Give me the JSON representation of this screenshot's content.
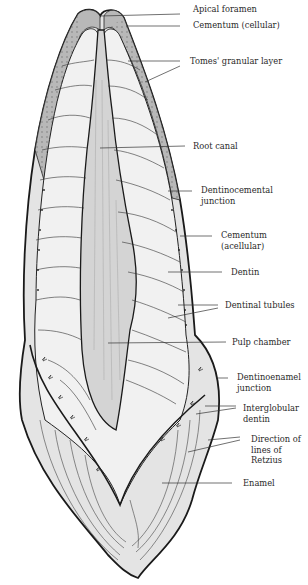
{
  "diagram": {
    "labels": [
      {
        "id": "apical-foramen",
        "text": "Apical foramen",
        "x": 193,
        "y": 6
      },
      {
        "id": "cementum-cellular",
        "text": "Cementum (cellular)",
        "x": 193,
        "y": 21
      },
      {
        "id": "tomes-granular-layer",
        "text": "Tomes' granular layer",
        "x": 190,
        "y": 55
      },
      {
        "id": "root-canal",
        "text": "Root canal",
        "x": 193,
        "y": 140
      },
      {
        "id": "dentinocemental-junction",
        "text": "Dentinocemental\njunction",
        "x": 201,
        "y": 183
      },
      {
        "id": "cementum-acellular",
        "text": "Cementum\n(acellular)",
        "x": 221,
        "y": 230
      },
      {
        "id": "dentin",
        "text": "Dentin",
        "x": 231,
        "y": 268
      },
      {
        "id": "dentinal-tubules",
        "text": "Dentinal tubules",
        "x": 225,
        "y": 301
      },
      {
        "id": "pulp-chamber",
        "text": "Pulp chamber",
        "x": 232,
        "y": 336
      },
      {
        "id": "dentinoenamel-junction",
        "text": "Dentinoenamel\njunction",
        "x": 237,
        "y": 370
      },
      {
        "id": "interglobular-dentin",
        "text": "Interglobular\ndentin",
        "x": 243,
        "y": 402
      },
      {
        "id": "direction-lines-retzius",
        "text": "Direction of\nlines of\nRetzius",
        "x": 251,
        "y": 433
      },
      {
        "id": "enamel",
        "text": "Enamel",
        "x": 243,
        "y": 478
      }
    ]
  }
}
